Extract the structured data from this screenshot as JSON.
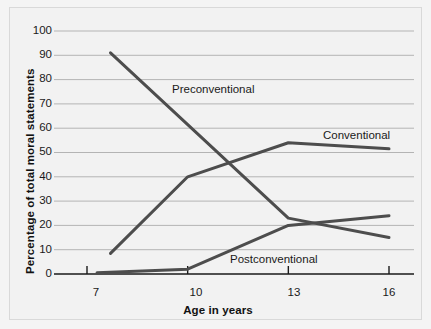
{
  "chart_data": {
    "type": "line",
    "title": "",
    "xlabel": "Age in years",
    "ylabel": "Percentage of total moral statements",
    "xlim": [
      7,
      16
    ],
    "ylim": [
      0,
      100
    ],
    "grid": true,
    "grid_axis": "y",
    "legend_position": "inline-annotations",
    "xticks": [
      7,
      10,
      13,
      16
    ],
    "xtick_labels": [
      "7",
      "10",
      "13",
      "16"
    ],
    "yticks": [
      0,
      10,
      20,
      30,
      40,
      50,
      60,
      70,
      80,
      90,
      100
    ],
    "ytick_labels": [
      "0",
      "10",
      "20",
      "30",
      "40",
      "50",
      "60",
      "70",
      "80",
      "90",
      "100"
    ],
    "line_color": "#4d4d4d",
    "series": [
      {
        "name": "Preconventional",
        "label": "Preconventional",
        "x": [
          7.7,
          13,
          16
        ],
        "values": [
          91,
          23,
          15
        ]
      },
      {
        "name": "Conventional",
        "label": "Conventional",
        "x": [
          7.7,
          10,
          13,
          16
        ],
        "values": [
          8.5,
          40,
          54,
          51.5
        ]
      },
      {
        "name": "Postconventional",
        "label": "Postconventional",
        "x": [
          7.3,
          10,
          13,
          16
        ],
        "values": [
          0.5,
          2,
          20,
          24
        ]
      }
    ],
    "annotations": [
      {
        "text": "Preconventional",
        "x_px": 171,
        "y_px": 82
      },
      {
        "text": "Conventional",
        "x_px": 322,
        "y_px": 128
      },
      {
        "text": "Postconventional",
        "x_px": 229,
        "y_px": 252
      }
    ]
  },
  "axis": {
    "x_title": "Age in years",
    "y_title": "Percentage of total moral statements"
  },
  "colors": {
    "page_background": "#f4f4f4",
    "panel_background": "#f2f2f2",
    "panel_border": "#d9d9d9",
    "gridline": "#b4b4b4",
    "axis": "#1a1a1a",
    "series_line": "#4d4d4d",
    "text": "#1a1a1a"
  }
}
